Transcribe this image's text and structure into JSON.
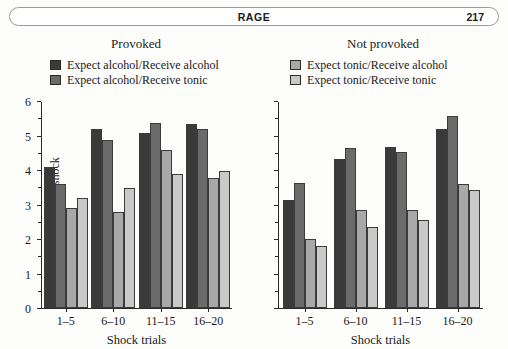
{
  "running_head": {
    "title": "RAGE",
    "page_number": "217"
  },
  "chart_data": {
    "type": "bar",
    "title": "",
    "categories": [
      "1–5",
      "6–10",
      "11–15",
      "16–20"
    ],
    "xlabel": "Shock trials",
    "ylabel": "Mean level of shock",
    "ylim": [
      0,
      6
    ],
    "yticks": [
      0,
      1,
      2,
      3,
      4,
      5,
      6
    ],
    "ytick_labels": [
      "0",
      "1",
      "2",
      "3",
      "4",
      "5",
      "6"
    ],
    "minor_tick_step": 0.5,
    "grid": false,
    "legend_position": "above-plot",
    "panels": [
      {
        "name": "provoked",
        "title": "Provoked",
        "y_axis_labeled": true,
        "series": [
          {
            "name": "Expect alcohol/Receive alcohol",
            "color": "#3a3a3a",
            "values": [
              4.1,
              5.2,
              5.1,
              5.35
            ]
          },
          {
            "name": "Expect alcohol/Receive tonic",
            "color": "#6b6b6b",
            "values": [
              3.6,
              4.9,
              5.4,
              5.2
            ]
          },
          {
            "name": "Expect tonic/Receive alcohol",
            "color": "#a8a8a8",
            "values": [
              2.9,
              2.8,
              4.6,
              3.8
            ]
          },
          {
            "name": "Expect tonic/Receive tonic",
            "color": "#c9c9c9",
            "values": [
              3.2,
              3.5,
              3.9,
              4.0
            ]
          }
        ]
      },
      {
        "name": "not-provoked",
        "title": "Not provoked",
        "y_axis_labeled": false,
        "series": [
          {
            "name": "Expect alcohol/Receive alcohol",
            "color": "#3a3a3a",
            "values": [
              3.15,
              4.35,
              4.7,
              5.2
            ]
          },
          {
            "name": "Expect alcohol/Receive tonic",
            "color": "#6b6b6b",
            "values": [
              3.65,
              4.65,
              4.55,
              5.6
            ]
          },
          {
            "name": "Expect tonic/Receive alcohol",
            "color": "#a8a8a8",
            "values": [
              2.0,
              2.85,
              2.85,
              3.6
            ]
          },
          {
            "name": "Expect tonic/Receive tonic",
            "color": "#c9c9c9",
            "values": [
              1.8,
              2.35,
              2.55,
              3.45
            ]
          }
        ]
      }
    ],
    "legends": [
      {
        "panel": "provoked",
        "entries": [
          {
            "label": "Expect alcohol/Receive alcohol",
            "color": "#3a3a3a"
          },
          {
            "label": "Expect alcohol/Receive tonic",
            "color": "#6b6b6b"
          }
        ]
      },
      {
        "panel": "not-provoked",
        "entries": [
          {
            "label": "Expect tonic/Receive alcohol",
            "color": "#a8a8a8"
          },
          {
            "label": "Expect tonic/Receive tonic",
            "color": "#c9c9c9"
          }
        ]
      }
    ]
  }
}
